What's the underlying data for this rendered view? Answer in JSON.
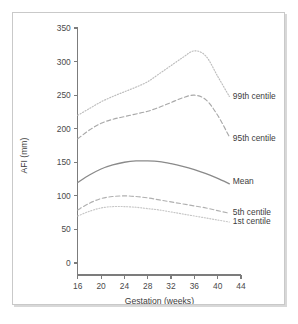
{
  "figure": {
    "background_color": "#ffffff",
    "frame_color": "#c9c9c9",
    "axis_color": "#7c7c7c",
    "text_color": "#3c3c3c"
  },
  "chart_data": {
    "type": "line",
    "title": "",
    "xlabel": "Gestation (weeks)",
    "ylabel": "AFI (mm)",
    "xlim": [
      14.5,
      44
    ],
    "ylim": [
      0,
      350
    ],
    "xticks": [
      16,
      20,
      24,
      28,
      32,
      36,
      40,
      44
    ],
    "yticks": [
      0,
      50,
      100,
      150,
      200,
      250,
      300,
      350
    ],
    "grid": false,
    "legend_position": "right-inline",
    "x": [
      16,
      18,
      20,
      22,
      24,
      26,
      28,
      30,
      32,
      34,
      36,
      38,
      40,
      42
    ],
    "series": [
      {
        "name": "99th centile",
        "label": "99th centile",
        "style": "dotted",
        "color": "#bdbdbd",
        "label_x": 42.6,
        "label_y": 248,
        "values": [
          220,
          230,
          240,
          248,
          255,
          262,
          270,
          282,
          294,
          306,
          316,
          308,
          278,
          248
        ]
      },
      {
        "name": "95th centile",
        "label": "95th centile",
        "style": "dashed",
        "color": "#a8a8a8",
        "label_x": 42.6,
        "label_y": 186,
        "values": [
          185,
          198,
          208,
          214,
          218,
          222,
          226,
          232,
          239,
          246,
          250,
          243,
          220,
          188
        ]
      },
      {
        "name": "Mean",
        "label": "Mean",
        "style": "solid",
        "color": "#8a8a8a",
        "label_x": 42.6,
        "label_y": 122,
        "values": [
          120,
          131,
          140,
          146,
          150,
          152,
          152,
          151,
          148,
          144,
          139,
          133,
          126,
          118
        ]
      },
      {
        "name": "5th centile",
        "label": "5th centile",
        "style": "dashed",
        "color": "#b0b0b0",
        "label_x": 42.6,
        "label_y": 76,
        "values": [
          79,
          89,
          96,
          99,
          100,
          99,
          97,
          94,
          91,
          88,
          85,
          82,
          78,
          74
        ]
      },
      {
        "name": "1st centile",
        "label": "1st centile",
        "style": "dotted",
        "color": "#c6c6c6",
        "label_x": 42.6,
        "label_y": 62,
        "values": [
          70,
          77,
          82,
          84,
          84,
          83,
          81,
          79,
          76,
          73,
          70,
          67,
          64,
          61
        ]
      }
    ]
  }
}
